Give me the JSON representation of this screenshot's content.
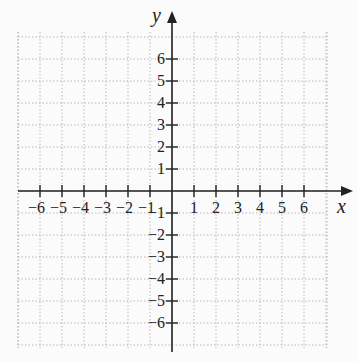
{
  "chart_data": {
    "type": "scatter",
    "title": "",
    "xlabel": "x",
    "ylabel": "y",
    "xlim": [
      -7,
      7
    ],
    "ylim": [
      -7,
      7
    ],
    "x_ticks": [
      -6,
      -5,
      -4,
      -3,
      -2,
      -1,
      1,
      2,
      3,
      4,
      5,
      6
    ],
    "y_ticks": [
      6,
      5,
      4,
      3,
      2,
      1,
      -1,
      -2,
      -3,
      -4,
      -5,
      -6
    ],
    "x_tick_labels": [
      "−6",
      "−5",
      "−4",
      "−3",
      "−2",
      "−1",
      "1",
      "2",
      "3",
      "4",
      "5",
      "6"
    ],
    "y_tick_labels": [
      "6",
      "5",
      "4",
      "3",
      "2",
      "1",
      "−1",
      "−2",
      "−3",
      "−4",
      "−5",
      "−6"
    ],
    "grid": true,
    "grid_style": "dotted",
    "points": [],
    "colors": {
      "axis": "#222222",
      "grid": "#b8b8b8",
      "background": "#fbfbfb"
    }
  }
}
